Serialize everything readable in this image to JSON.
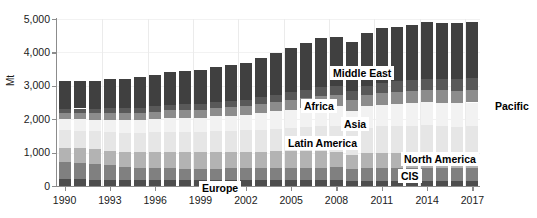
{
  "chart_data": {
    "type": "bar",
    "stacked": true,
    "title": "",
    "subtitle": "",
    "xlabel": "",
    "ylabel": "Mt",
    "ylim": [
      0,
      5000
    ],
    "ytick_labels": [
      "0",
      "1,000",
      "2,000",
      "3,000",
      "4,000",
      "5,000"
    ],
    "ytick_values": [
      0,
      1000,
      2000,
      3000,
      4000,
      5000
    ],
    "grid": "both",
    "legend_position": "inline-callouts",
    "x": [
      1990,
      1991,
      1992,
      1993,
      1994,
      1995,
      1996,
      1997,
      1998,
      1999,
      2000,
      2001,
      2002,
      2003,
      2004,
      2005,
      2006,
      2007,
      2008,
      2009,
      2010,
      2011,
      2012,
      2013,
      2014,
      2015,
      2016,
      2017
    ],
    "xtick_labels": [
      "1990",
      "1993",
      "1996",
      "1999",
      "2002",
      "2005",
      "2008",
      "2011",
      "2014",
      "2017"
    ],
    "xtick_values": [
      1990,
      1993,
      1996,
      1999,
      2002,
      2005,
      2008,
      2011,
      2014,
      2017
    ],
    "series": [
      {
        "name": "Europe",
        "color": "#4d4d4d",
        "values": [
          200,
          195,
          190,
          185,
          180,
          180,
          182,
          180,
          178,
          175,
          175,
          175,
          173,
          172,
          172,
          170,
          170,
          168,
          165,
          150,
          158,
          155,
          150,
          148,
          148,
          150,
          152,
          153
        ]
      },
      {
        "name": "CIS",
        "color": "#808080",
        "values": [
          520,
          500,
          470,
          430,
          390,
          370,
          360,
          350,
          340,
          340,
          345,
          350,
          352,
          360,
          365,
          370,
          378,
          385,
          390,
          360,
          378,
          390,
          392,
          390,
          392,
          385,
          388,
          392
        ]
      },
      {
        "name": "North America",
        "color": "#b3b3b3",
        "values": [
          430,
          430,
          435,
          445,
          455,
          460,
          470,
          480,
          485,
          490,
          495,
          490,
          492,
          495,
          500,
          505,
          500,
          495,
          470,
          410,
          440,
          445,
          450,
          455,
          460,
          450,
          445,
          445
        ]
      },
      {
        "name": "Latin America",
        "color": "#e6e6e6",
        "values": [
          520,
          530,
          540,
          555,
          570,
          580,
          595,
          615,
          625,
          620,
          635,
          640,
          645,
          660,
          680,
          700,
          720,
          745,
          765,
          740,
          775,
          795,
          805,
          810,
          815,
          800,
          790,
          795
        ]
      },
      {
        "name": "Asia",
        "color": "#f2f2f2",
        "values": [
          330,
          340,
          350,
          365,
          375,
          385,
          400,
          415,
          420,
          425,
          440,
          450,
          465,
          490,
          515,
          540,
          565,
          590,
          600,
          595,
          630,
          655,
          670,
          680,
          695,
          700,
          705,
          715
        ]
      },
      {
        "name": "Africa",
        "color": "#8c8c8c",
        "values": [
          190,
          195,
          200,
          205,
          210,
          215,
          220,
          228,
          232,
          235,
          242,
          248,
          255,
          268,
          280,
          292,
          305,
          318,
          325,
          320,
          338,
          350,
          358,
          365,
          372,
          375,
          378,
          382
        ]
      },
      {
        "name": "Middle East",
        "color": "#595959",
        "values": [
          125,
          130,
          135,
          140,
          145,
          150,
          158,
          165,
          170,
          175,
          182,
          190,
          198,
          210,
          222,
          235,
          248,
          262,
          272,
          272,
          288,
          300,
          312,
          320,
          330,
          335,
          340,
          345
        ]
      },
      {
        "name": "Pacific",
        "color": "#404040",
        "values": [
          815,
          820,
          830,
          865,
          885,
          915,
          950,
          985,
          1000,
          1000,
          1040,
          1070,
          1100,
          1175,
          1250,
          1320,
          1390,
          1465,
          1460,
          1455,
          1565,
          1640,
          1615,
          1665,
          1700,
          1685,
          1685,
          1695
        ]
      }
    ],
    "totals": [
      3130,
      3140,
      3150,
      3190,
      3210,
      3255,
      3335,
      3418,
      3450,
      3460,
      3552,
      3613,
      3680,
      3830,
      3984,
      4132,
      4276,
      4428,
      4447,
      4302,
      4572,
      4730,
      4752,
      4833,
      4912,
      4880,
      4883,
      4922
    ],
    "annotations": [
      {
        "id": "middle-east",
        "text": "Middle East"
      },
      {
        "id": "africa",
        "text": "Africa"
      },
      {
        "id": "asia",
        "text": "Asia"
      },
      {
        "id": "latin-america",
        "text": "Latin America"
      },
      {
        "id": "north-america",
        "text": "North America"
      },
      {
        "id": "cis",
        "text": "CIS"
      },
      {
        "id": "europe",
        "text": "Europe"
      },
      {
        "id": "pacific",
        "text": "Pacific"
      }
    ]
  }
}
